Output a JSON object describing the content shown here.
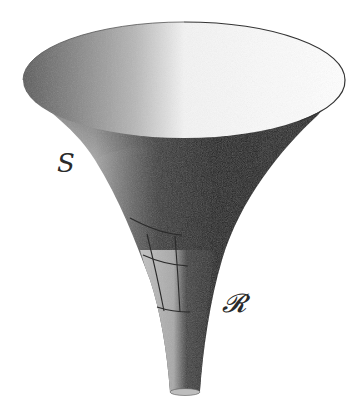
{
  "figure": {
    "labels": {
      "surface": "S",
      "region": "𝓡"
    },
    "colors": {
      "background": "#ffffff",
      "rim_stroke": "#333333",
      "grid_stroke": "#2a2a2a",
      "shade_dark": "#1e1e1e",
      "shade_mid": "#7a7a7a",
      "shade_light": "#d8d8d8"
    }
  }
}
